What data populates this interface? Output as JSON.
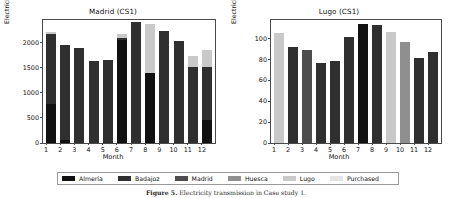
{
  "figure": {
    "caption_label": "Figure 5.",
    "caption_text": "Electricity transmission in Case study 1."
  },
  "legend": {
    "position": "bottom-center",
    "items": [
      {
        "label": "Almería",
        "color": "#111111"
      },
      {
        "label": "Badajoz",
        "color": "#2f2f2f"
      },
      {
        "label": "Madrid",
        "color": "#4d4d4d"
      },
      {
        "label": "Huesca",
        "color": "#8f8f8f"
      },
      {
        "label": "Lugo",
        "color": "#c9c9c9"
      },
      {
        "label": "Purchased",
        "color": "#e4e4e4"
      }
    ]
  },
  "chart_data": [
    {
      "id": "madrid",
      "type": "bar",
      "stacked": true,
      "title": "Madrid (CS1)",
      "xlabel": "Month",
      "ylabel": "Electricity transmitted [GWh]",
      "categories": [
        "1",
        "2",
        "3",
        "4",
        "5",
        "6",
        "7",
        "8",
        "9",
        "10",
        "11",
        "12"
      ],
      "yticks": [
        0,
        500,
        1000,
        1500,
        2000
      ],
      "ylim": [
        0,
        2450
      ],
      "grid": false,
      "series": [
        {
          "name": "Almería",
          "color": "#111111",
          "values": [
            780,
            70,
            0,
            0,
            0,
            2050,
            0,
            1400,
            0,
            0,
            0,
            465
          ]
        },
        {
          "name": "Badajoz",
          "color": "#2f2f2f",
          "values": [
            1400,
            1880,
            1885,
            1625,
            1660,
            45,
            2405,
            0,
            2235,
            2040,
            1505,
            1040
          ]
        },
        {
          "name": "Madrid",
          "color": "#4d4d4d",
          "values": [
            0,
            0,
            0,
            0,
            0,
            0,
            0,
            0,
            0,
            0,
            0,
            0
          ]
        },
        {
          "name": "Huesca",
          "color": "#8f8f8f",
          "values": [
            0,
            0,
            0,
            0,
            0,
            0,
            0,
            0,
            0,
            0,
            0,
            0
          ]
        },
        {
          "name": "Lugo",
          "color": "#c9c9c9",
          "values": [
            35,
            0,
            0,
            0,
            0,
            85,
            0,
            970,
            0,
            0,
            235,
            345
          ]
        },
        {
          "name": "Purchased",
          "color": "#e4e4e4",
          "values": [
            0,
            0,
            0,
            0,
            0,
            0,
            0,
            0,
            0,
            0,
            0,
            0
          ]
        }
      ],
      "totals": [
        2215,
        1950,
        1885,
        1625,
        1660,
        2180,
        2405,
        2370,
        2235,
        2040,
        1740,
        1850
      ]
    },
    {
      "id": "lugo",
      "type": "bar",
      "stacked": true,
      "title": "Lugo (CS1)",
      "xlabel": "Month",
      "ylabel": "Electricity transmitted [GWh]",
      "categories": [
        "1",
        "2",
        "3",
        "4",
        "5",
        "6",
        "7",
        "8",
        "9",
        "10",
        "11",
        "12"
      ],
      "yticks": [
        0,
        20,
        40,
        60,
        80,
        100
      ],
      "ylim": [
        0,
        118
      ],
      "grid": false,
      "series": [
        {
          "name": "Almería",
          "color": "#111111",
          "values": [
            0,
            0,
            0,
            0,
            0,
            0,
            114,
            0,
            0,
            0,
            0,
            0
          ]
        },
        {
          "name": "Badajoz",
          "color": "#2f2f2f",
          "values": [
            0,
            92.5,
            0,
            77,
            78.5,
            101.5,
            0,
            113,
            0,
            0,
            82,
            87
          ]
        },
        {
          "name": "Madrid",
          "color": "#4d4d4d",
          "values": [
            0,
            0,
            89,
            0,
            0,
            0,
            0,
            0,
            0,
            0,
            0,
            0
          ]
        },
        {
          "name": "Huesca",
          "color": "#8f8f8f",
          "values": [
            0,
            0,
            0,
            0,
            0,
            0,
            0,
            0,
            0,
            96.5,
            0,
            0
          ]
        },
        {
          "name": "Lugo",
          "color": "#c9c9c9",
          "values": [
            105.5,
            0,
            0,
            0,
            0,
            0,
            0,
            0,
            106.5,
            0,
            0,
            0
          ]
        },
        {
          "name": "Purchased",
          "color": "#e4e4e4",
          "values": [
            0,
            0,
            0,
            0,
            0,
            0,
            0,
            0,
            0,
            0,
            0,
            0
          ]
        }
      ],
      "totals": [
        105.5,
        92.5,
        89,
        77,
        78.5,
        101.5,
        114,
        113,
        106.5,
        96.5,
        82,
        87
      ]
    }
  ]
}
